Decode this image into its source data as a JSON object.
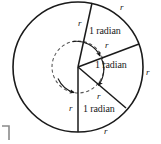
{
  "figure": {
    "stroke_color": "#1a1a1a",
    "dashed_color": "#555555",
    "background": "#ffffff",
    "circle": {
      "center_x": 78,
      "center_y": 67,
      "radius": 65
    },
    "inner_dashed_circle": {
      "center_x": 78,
      "center_y": 67,
      "radius": 26
    },
    "radii": [
      {
        "name": "radius-top",
        "angle_deg": -78,
        "end_x": 92,
        "end_y": 3
      },
      {
        "name": "radius-upper-right",
        "angle_deg": -21,
        "end_x": 139,
        "end_y": 44
      },
      {
        "name": "radius-lower-right",
        "angle_deg": 36,
        "end_x": 126,
        "end_y": 108
      },
      {
        "name": "radius-bottom",
        "angle_deg": 90,
        "end_x": 78,
        "end_y": 132
      }
    ]
  },
  "labels": {
    "radian_top": "1 radian",
    "radian_middle": "1 radian",
    "radian_bottom": "1 radian",
    "r_upper_radius": "r",
    "r_top_arc": "r",
    "r_middle_radius": "r",
    "r_right_arc": "r",
    "r_lower_radius": "r",
    "r_bottom_left_radius": "r",
    "r_bottom_arc": "r"
  },
  "corner_mark": {
    "name": "crop-corner-mark",
    "visible": true
  }
}
